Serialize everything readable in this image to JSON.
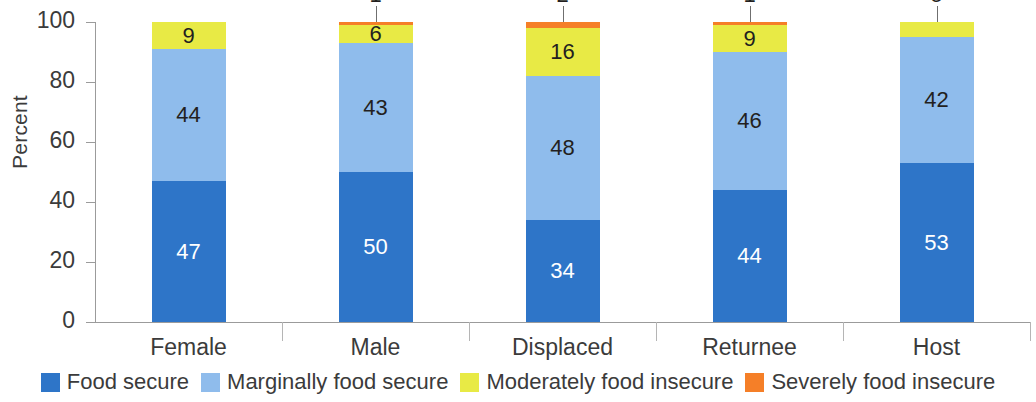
{
  "chart_data": {
    "type": "bar",
    "subtype": "stacked-bar-100",
    "title": "",
    "xlabel": "",
    "ylabel": "Percent",
    "ylim": [
      0,
      100
    ],
    "yticks": [
      0,
      20,
      40,
      60,
      80,
      100
    ],
    "ytick_labels": [
      "0",
      "20",
      "40",
      "60",
      "80",
      "100"
    ],
    "grid": false,
    "legend_position": "bottom",
    "categories": [
      "Female",
      "Male",
      "Displaced",
      "Returnee",
      "Host"
    ],
    "series": [
      {
        "name": "Food secure",
        "color": "#2E75C8",
        "values": [
          47,
          50,
          34,
          44,
          53
        ],
        "labels": [
          "47",
          "50",
          "34",
          "44",
          "53"
        ]
      },
      {
        "name": "Marginally food secure",
        "color": "#8FBCEC",
        "values": [
          44,
          43,
          48,
          46,
          42
        ],
        "labels": [
          "44",
          "43",
          "48",
          "46",
          "42"
        ]
      },
      {
        "name": "Moderately food insecure",
        "color": "#E8EA45",
        "values": [
          9,
          6,
          16,
          9,
          5
        ],
        "labels": [
          "9",
          "6",
          "16",
          "9",
          "5"
        ]
      },
      {
        "name": "Severely food insecure",
        "color": "#F57F28",
        "values": [
          0,
          1,
          2,
          1,
          0
        ],
        "labels": [
          "",
          "1",
          "2",
          "1",
          ""
        ]
      }
    ]
  },
  "axis": {
    "y_title": "Percent"
  },
  "legend": {
    "items": [
      {
        "label": "Food secure",
        "color": "#2E75C8"
      },
      {
        "label": "Marginally food secure",
        "color": "#8FBCEC"
      },
      {
        "label": "Moderately food insecure",
        "color": "#E8EA45"
      },
      {
        "label": "Severely food insecure",
        "color": "#F57F28"
      }
    ]
  }
}
